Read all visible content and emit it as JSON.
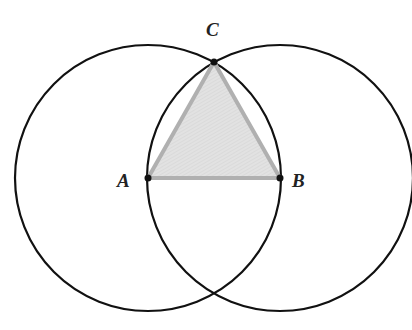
{
  "diagram": {
    "points": {
      "A": {
        "label": "A",
        "x": 148,
        "y": 178
      },
      "B": {
        "label": "B",
        "x": 280,
        "y": 178
      },
      "C": {
        "label": "C",
        "x": 214,
        "y": 62
      }
    },
    "circles": [
      {
        "center": "A",
        "radius": 133
      },
      {
        "center": "B",
        "radius": 133
      }
    ],
    "triangle": {
      "vertices": [
        "A",
        "B",
        "C"
      ],
      "fill": "#dedede",
      "stroke": "#b0b0b0"
    },
    "colors": {
      "circle": "#111111",
      "point": "#111111"
    }
  }
}
